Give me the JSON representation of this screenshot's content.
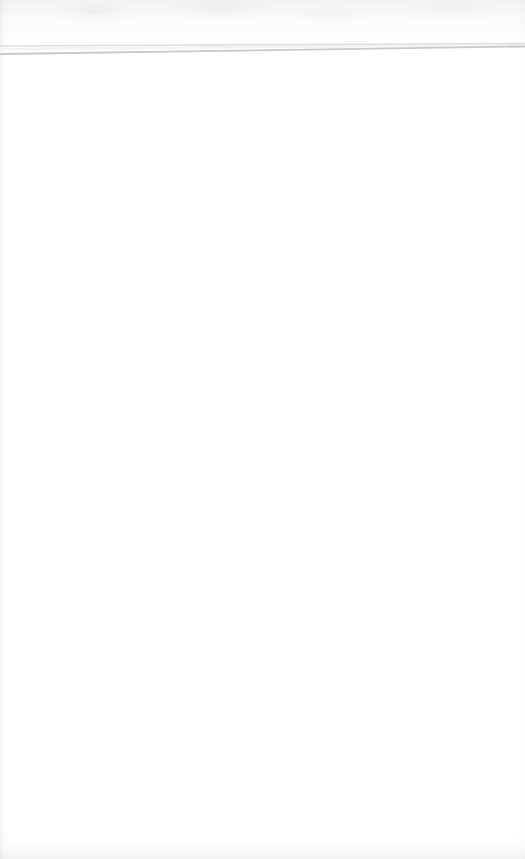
{
  "document": {
    "type": "scanned-page",
    "page_label": "",
    "body_text": "",
    "background_color": "#ffffff",
    "width_px": 525,
    "height_px": 859
  },
  "artifacts": {
    "top_noise_label": "",
    "left_edge_label": "",
    "right_edge_label": "",
    "bottom_edge_label": ""
  },
  "rules": {
    "upper_line": {
      "color": "#dcdee1",
      "x1": 0,
      "y1": 46,
      "x2": 525,
      "y2": 43.5,
      "thickness": 1.6
    },
    "lower_line": {
      "color": "#c6c9cd",
      "x1": 0,
      "y1": 54,
      "x2": 525,
      "y2": 46.5,
      "thickness": 1.8
    },
    "upper_highlight": {
      "color": "#f2f3f4",
      "x1": 0,
      "y1": 49,
      "x2": 525,
      "y2": 45,
      "thickness": 2.4
    }
  }
}
